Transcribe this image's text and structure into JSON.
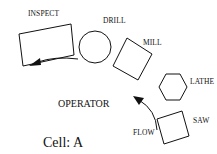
{
  "diagram": {
    "stations": [
      {
        "name": "INSPECT",
        "shape": "rectangle"
      },
      {
        "name": "DRILL",
        "shape": "circle"
      },
      {
        "name": "MILL",
        "shape": "square"
      },
      {
        "name": "LATHE",
        "shape": "hexagon"
      },
      {
        "name": "SAW",
        "shape": "square"
      }
    ],
    "center_label": "OPERATOR",
    "flow_label": "FLOW",
    "cell_label": "Cell: A",
    "stroke_color": "#111111",
    "background": "#ffffff"
  }
}
